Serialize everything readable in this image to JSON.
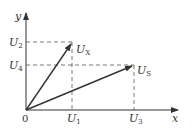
{
  "diagram": {
    "type": "vector-diagram",
    "axes": {
      "x_label": "x",
      "y_label": "y",
      "origin_label": "0"
    },
    "vectors": [
      {
        "name": "U",
        "subscript": "X",
        "from": "origin",
        "to_x": "U1",
        "to_y": "U2"
      },
      {
        "name": "U",
        "subscript": "S",
        "from": "origin",
        "to_x": "U3",
        "to_y": "U4"
      }
    ],
    "x_ticks": [
      {
        "name": "U",
        "subscript": "1"
      },
      {
        "name": "U",
        "subscript": "3"
      }
    ],
    "y_ticks": [
      {
        "name": "U",
        "subscript": "2"
      },
      {
        "name": "U",
        "subscript": "4"
      }
    ],
    "colors": {
      "line": "#333333",
      "dashed": "#555555"
    }
  }
}
